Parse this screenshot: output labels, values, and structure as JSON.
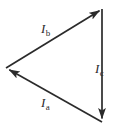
{
  "figure": {
    "kind": "phasor-triangle-diagram",
    "background_color": "#ffffff",
    "stroke_color": "#2b2b2b",
    "label_color": "#2b2b2b",
    "width": 117,
    "height": 131
  },
  "vectors": [
    {
      "id": "ia",
      "symbol": "I",
      "subscript": "a",
      "label": "Ia",
      "from": {
        "x": 102,
        "y": 122
      },
      "to": {
        "x": 6,
        "y": 68
      },
      "arrow_at": "to",
      "label_position": {
        "x": 41,
        "y": 96
      },
      "label_side": "below"
    },
    {
      "id": "ib",
      "symbol": "I",
      "subscript": "b",
      "label": "Ib",
      "from": {
        "x": 6,
        "y": 68
      },
      "to": {
        "x": 102,
        "y": 9
      },
      "arrow_at": "to",
      "label_position": {
        "x": 41,
        "y": 22
      },
      "label_side": "above"
    },
    {
      "id": "ic",
      "symbol": "I",
      "subscript": "c",
      "label": "Ic",
      "from": {
        "x": 102,
        "y": 9
      },
      "to": {
        "x": 102,
        "y": 122
      },
      "arrow_at": "to",
      "label_position": {
        "x": 95,
        "y": 62
      },
      "label_side": "right"
    }
  ]
}
